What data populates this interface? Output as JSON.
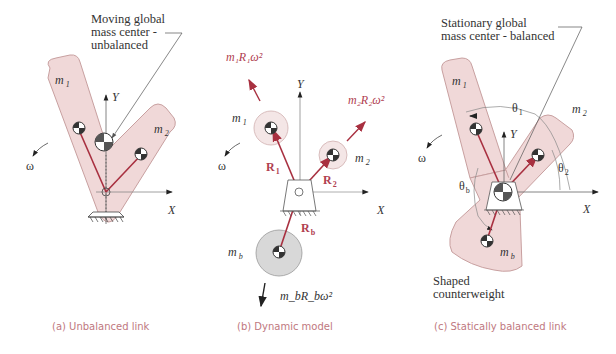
{
  "panels": [
    {
      "id": "a",
      "caption": "(a)  Unbalanced link",
      "annotation_lines": [
        "Moving global",
        "mass center -",
        "unbalanced"
      ],
      "labels": {
        "m1": "m",
        "m1_sub": "1",
        "m2": "m",
        "m2_sub": "2",
        "omega": "ω",
        "x_axis": "X",
        "y_axis": "Y"
      }
    },
    {
      "id": "b",
      "caption": "(b)  Dynamic model",
      "labels": {
        "m1": "m",
        "m1_sub": "1",
        "m2": "m",
        "m2_sub": "2",
        "mb": "m",
        "mb_sub": "b",
        "omega": "ω",
        "x_axis": "X",
        "y_axis": "Y",
        "R1": "R",
        "R1_sub": "1",
        "R2": "R",
        "R2_sub": "2",
        "Rb": "R",
        "Rb_sub": "b",
        "force1": "m₁R₁ω²",
        "force2": "m₂R₂ω²",
        "forceb": "m_bR_bω²"
      }
    },
    {
      "id": "c",
      "caption": "(c)  Statically balanced link",
      "annotation_lines": [
        "Stationary global",
        "mass center - balanced"
      ],
      "counterweight_lines": [
        "Shaped",
        "counterweight"
      ],
      "labels": {
        "m1": "m",
        "m1_sub": "1",
        "m2": "m",
        "m2_sub": "2",
        "mb": "m",
        "mb_sub": "b",
        "omega": "ω",
        "x_axis": "X",
        "y_axis": "Y",
        "theta1": "θ",
        "theta1_sub": "1",
        "theta2": "θ",
        "theta2_sub": "2",
        "thetab": "θ",
        "thetab_sub": "b"
      }
    }
  ],
  "colors": {
    "link_fill": "#f0d8d8",
    "link_stroke": "#c8a0a0",
    "vector_red": "#a83040",
    "caption_pink": "#c07880",
    "mass_gray": "#d8d8d8"
  }
}
